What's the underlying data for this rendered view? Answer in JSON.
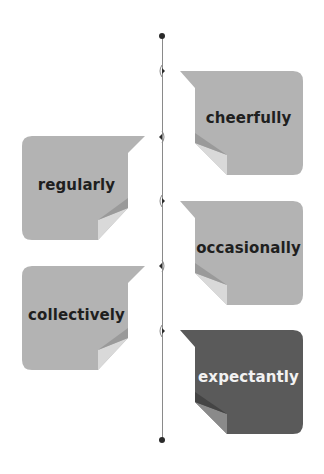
{
  "timeline": {
    "colors": {
      "line": "#8a8a8a",
      "dot": "#2a2a2a"
    },
    "items": [
      {
        "label": "cheerfully",
        "side": "right",
        "style": "light"
      },
      {
        "label": "regularly",
        "side": "left",
        "style": "light"
      },
      {
        "label": "occasionally",
        "side": "right",
        "style": "light"
      },
      {
        "label": "collectively",
        "side": "left",
        "style": "light"
      },
      {
        "label": "expectantly",
        "side": "right",
        "style": "dark"
      }
    ]
  },
  "palette": {
    "light_card": "#b3b3b3",
    "light_fold": "#d9d9d9",
    "light_fold_shadow": "#9a9a9a",
    "dark_card": "#5a5a5a",
    "dark_fold": "#8a8a8a",
    "dark_fold_shadow": "#444444",
    "text_dark": "#1f1f1f",
    "text_light": "#f2f2f2"
  }
}
